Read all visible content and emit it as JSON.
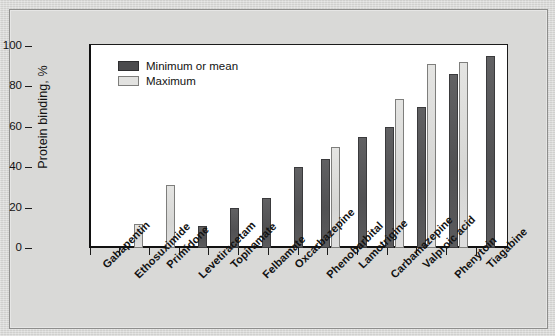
{
  "chart_data": {
    "type": "bar",
    "title": "",
    "xlabel": "",
    "ylabel": "Protein binding, %",
    "ylim": [
      0,
      100
    ],
    "yticks": [
      0,
      20,
      40,
      60,
      80,
      100
    ],
    "grid": false,
    "legend_position": "top-left",
    "categories": [
      "Gabapentin",
      "Ethosuximide",
      "Primidone",
      "Levetiracetam",
      "Topiramate",
      "Felbamate",
      "Oxcarbazepine",
      "Phenobarbital",
      "Lamotrigine",
      "Carbamazepine",
      "Valproic acid",
      "Phenytoin",
      "Tiagabine"
    ],
    "series": [
      {
        "name": "Minimum or mean",
        "color": "#58585a",
        "values": [
          0,
          0,
          0,
          11,
          20,
          25,
          40,
          44,
          55,
          60,
          70,
          86,
          95
        ]
      },
      {
        "name": "Maximum",
        "color": "#dcdcda",
        "values": [
          0,
          12,
          31,
          0,
          0,
          0,
          0,
          50,
          0,
          74,
          91,
          92,
          0
        ]
      }
    ]
  },
  "axis": {
    "y_title": "Protein binding, %",
    "y_ticks": [
      "0",
      "20",
      "40",
      "60",
      "80",
      "100"
    ]
  },
  "legend": {
    "items": [
      {
        "label": "Minimum or mean",
        "swatch": "dark-square-swatch"
      },
      {
        "label": "Maximum",
        "swatch": "light-square-swatch"
      }
    ]
  }
}
